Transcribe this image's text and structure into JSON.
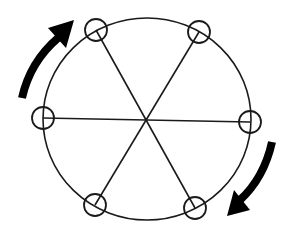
{
  "diagram": {
    "colors": {
      "line": "#1a1a1a",
      "arrow": "#000000",
      "background": "#ffffff"
    },
    "center": {
      "x": 147,
      "y": 119
    },
    "outer_circle": {
      "rx": 104,
      "ry": 101
    },
    "nodes": [
      {
        "id": "node-top-left",
        "x": 96,
        "y": 30
      },
      {
        "id": "node-top-right",
        "x": 199,
        "y": 32
      },
      {
        "id": "node-right",
        "x": 250,
        "y": 122
      },
      {
        "id": "node-bottom-right",
        "x": 195,
        "y": 208
      },
      {
        "id": "node-bottom-left",
        "x": 95,
        "y": 205
      },
      {
        "id": "node-left",
        "x": 43,
        "y": 118
      }
    ],
    "node_radius": 11,
    "spokes": 3,
    "arrows": [
      {
        "id": "arrow-upper-left",
        "direction": "clockwise",
        "position": "upper-left"
      },
      {
        "id": "arrow-lower-right",
        "direction": "clockwise",
        "position": "lower-right"
      }
    ]
  }
}
